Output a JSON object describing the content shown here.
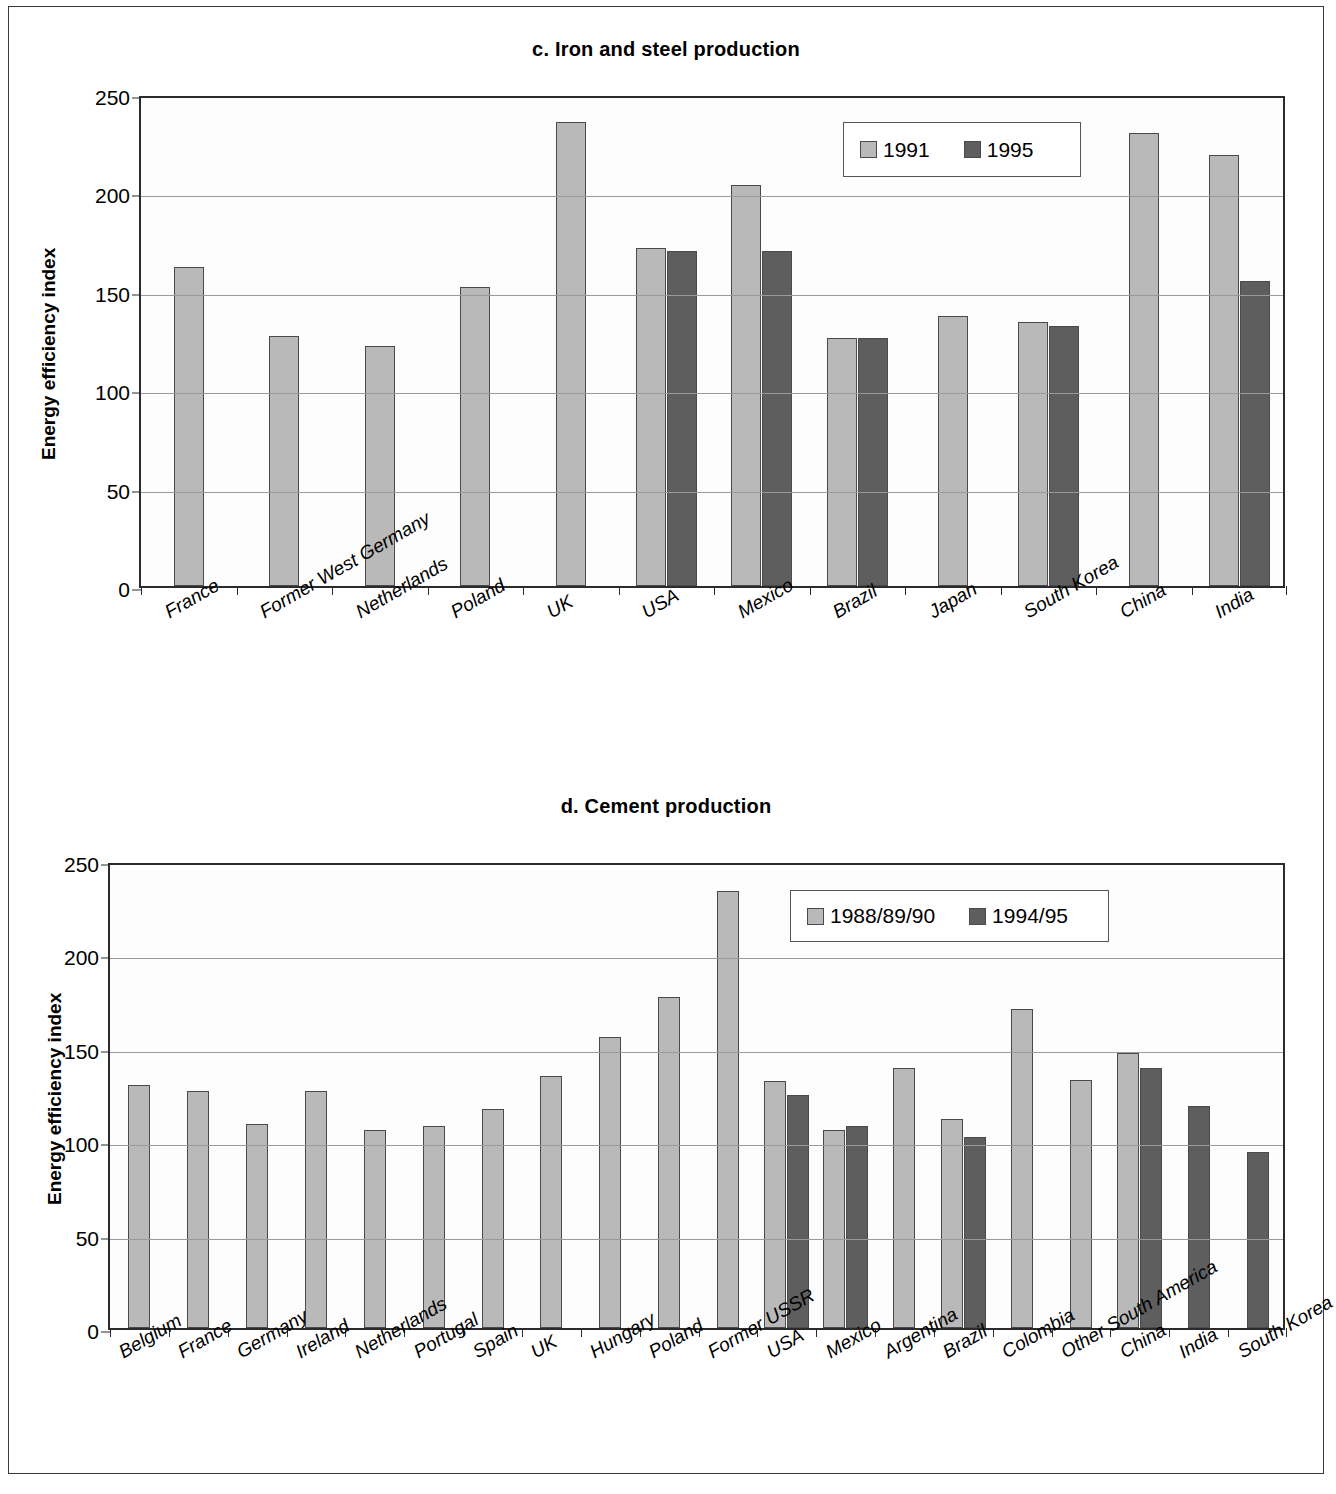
{
  "figure": {
    "panels": [
      {
        "id": "panel-c",
        "title": "c. Iron and steel production",
        "ylabel": "Energy efficiency index",
        "legend": [
          {
            "label": "1991",
            "color": "#b9b9b9"
          },
          {
            "label": "1995",
            "color": "#5e5e5e"
          }
        ]
      },
      {
        "id": "panel-d",
        "title": "d. Cement production",
        "ylabel": "Energy efficiency index",
        "legend": [
          {
            "label": "1988/89/90",
            "color": "#b9b9b9"
          },
          {
            "label": "1994/95",
            "color": "#5e5e5e"
          }
        ]
      }
    ]
  },
  "chart_data": [
    {
      "type": "bar",
      "title": "c. Iron and steel production",
      "xlabel": "",
      "ylabel": "Energy efficiency index",
      "ylim": [
        0,
        250
      ],
      "yticks": [
        0,
        50,
        100,
        150,
        200,
        250
      ],
      "grid": true,
      "legend_position": "top-right",
      "categories": [
        "France",
        "Former West Germany",
        "Netherlands",
        "Poland",
        "UK",
        "USA",
        "Mexico",
        "Brazil",
        "Japan",
        "South Korea",
        "China",
        "India"
      ],
      "series": [
        {
          "name": "1991",
          "color": "#b9b9b9",
          "values": [
            162,
            127,
            122,
            152,
            236,
            172,
            204,
            126,
            137,
            134,
            230,
            219
          ]
        },
        {
          "name": "1995",
          "color": "#5e5e5e",
          "values": [
            null,
            null,
            null,
            null,
            null,
            170,
            170,
            126,
            null,
            132,
            null,
            155
          ]
        }
      ]
    },
    {
      "type": "bar",
      "title": "d. Cement production",
      "xlabel": "",
      "ylabel": "Energy efficiency index",
      "ylim": [
        0,
        250
      ],
      "yticks": [
        0,
        50,
        100,
        150,
        200,
        250
      ],
      "grid": true,
      "legend_position": "top-right",
      "categories": [
        "Belgium",
        "France",
        "Germany",
        "Ireland",
        "Netherlands",
        "Portugal",
        "Spain",
        "UK",
        "Hungary",
        "Poland",
        "Former USSR",
        "USA",
        "Mexico",
        "Argentina",
        "Brazil",
        "Colombia",
        "Other South America",
        "China",
        "India",
        "South Korea"
      ],
      "series": [
        {
          "name": "1988/89/90",
          "color": "#b9b9b9",
          "values": [
            130,
            127,
            109,
            127,
            106,
            108,
            117,
            135,
            156,
            177,
            234,
            132,
            106,
            139,
            112,
            171,
            133,
            147,
            null,
            null
          ]
        },
        {
          "name": "1994/95",
          "color": "#5e5e5e",
          "values": [
            null,
            null,
            null,
            null,
            null,
            null,
            null,
            null,
            null,
            null,
            null,
            125,
            108,
            null,
            102,
            null,
            null,
            139,
            119,
            94
          ]
        }
      ]
    }
  ]
}
